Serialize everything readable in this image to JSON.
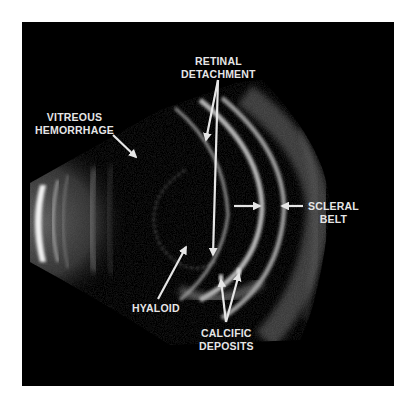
{
  "figure": {
    "type": "B-scan ultrasound",
    "background": "#000000",
    "page_background": "#ffffff",
    "label_color": "#e6e6e6"
  },
  "labels": {
    "retinal_detachment": {
      "line1": "RETINAL",
      "line2": "DETACHMENT"
    },
    "vitreous_hemorrhage": {
      "line1": "VITREOUS",
      "line2": "HEMORRHAGE"
    },
    "scleral_belt": {
      "line1": "SCLERAL",
      "line2": "BELT"
    },
    "hyaloid": {
      "line1": "HYALOID"
    },
    "calcific_deposits": {
      "line1": "CALCIFIC",
      "line2": "DEPOSITS"
    }
  },
  "arrows": [
    {
      "label": "retinal_detachment",
      "from": [
        218,
        80
      ],
      "to": [
        206,
        140
      ]
    },
    {
      "label": "retinal_detachment",
      "from": [
        218,
        80
      ],
      "to": [
        213,
        255
      ]
    },
    {
      "label": "vitreous_hemorrhage",
      "from": [
        113,
        135
      ],
      "to": [
        136,
        157
      ]
    },
    {
      "label": "scleral_belt",
      "from": [
        234,
        206
      ],
      "to": [
        260,
        206
      ]
    },
    {
      "label": "scleral_belt",
      "from": [
        303,
        206
      ],
      "to": [
        282,
        206
      ]
    },
    {
      "label": "hyaloid",
      "from": [
        158,
        299
      ],
      "to": [
        186,
        247
      ]
    },
    {
      "label": "calcific_deposits",
      "from": [
        226,
        322
      ],
      "to": [
        221,
        280
      ]
    },
    {
      "label": "calcific_deposits",
      "from": [
        226,
        322
      ],
      "to": [
        239,
        274
      ]
    }
  ]
}
